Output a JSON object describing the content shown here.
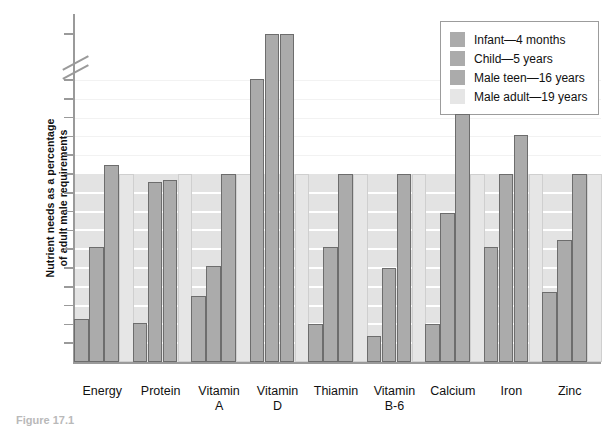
{
  "chart_data": {
    "type": "bar",
    "title": "",
    "xlabel": "",
    "ylabel": "Nutrient needs as a percentage of adult male requirements",
    "ylabel_line1": "Nutrient needs as a percentage",
    "ylabel_line2": "of adult male requirements",
    "categories": [
      "Energy",
      "Protein",
      "Vitamin\nA",
      "Vitamin\nD",
      "Thiamin",
      "Vitamin\nB-6",
      "Calcium",
      "Iron",
      "Zinc"
    ],
    "category_labels": [
      {
        "line1": "Energy",
        "line2": ""
      },
      {
        "line1": "Protein",
        "line2": ""
      },
      {
        "line1": "Vitamin",
        "line2": "A"
      },
      {
        "line1": "Vitamin",
        "line2": "D"
      },
      {
        "line1": "Thiamin",
        "line2": ""
      },
      {
        "line1": "Vitamin",
        "line2": "B-6"
      },
      {
        "line1": "Calcium",
        "line2": ""
      },
      {
        "line1": "Iron",
        "line2": ""
      },
      {
        "line1": "Zinc",
        "line2": ""
      }
    ],
    "series": [
      {
        "name": "Infant—4 months",
        "color": "#ababab",
        "values": [
          23,
          21,
          35,
          151,
          20,
          14,
          20,
          61,
          37
        ]
      },
      {
        "name": "Child—5 years",
        "color": "#ababab",
        "values": [
          61,
          96,
          51,
          200,
          61,
          50,
          79,
          100,
          65
        ]
      },
      {
        "name": "Male teen—16 years",
        "color": "#ababab",
        "values": [
          105,
          97,
          100,
          200,
          100,
          100,
          132,
          121,
          100
        ]
      },
      {
        "name": "Male adult—19 years",
        "color": "#e6e6e6",
        "values": [
          100,
          100,
          100,
          100,
          100,
          100,
          100,
          100,
          100
        ]
      }
    ],
    "ytick_labels": [
      "200",
      "150",
      "140",
      "130",
      "120",
      "110",
      "100",
      "90",
      "80",
      "70",
      "60",
      "50",
      "40",
      "30",
      "20",
      "10"
    ],
    "ytick_values": [
      200,
      150,
      140,
      130,
      120,
      110,
      100,
      90,
      80,
      70,
      60,
      50,
      40,
      30,
      20,
      10
    ],
    "ylim": [
      0,
      200
    ],
    "axis_break": true,
    "axis_break_between": [
      150,
      200
    ],
    "reference_line": 100,
    "grid": true,
    "legend_position": "top-right"
  },
  "legend": {
    "items": [
      {
        "label": "Infant—4 months",
        "color": "#ababab"
      },
      {
        "label": "Child—5 years",
        "color": "#ababab"
      },
      {
        "label": "Male teen—16 years",
        "color": "#ababab"
      },
      {
        "label": "Male adult—19 years",
        "color": "#e6e6e6"
      }
    ]
  },
  "caption": {
    "text": "Figure 17.1"
  },
  "colors": {
    "bar_fill": "#ababab",
    "bar_stroke": "#6d6d6d",
    "adult_fill": "#e6e6e6",
    "adult_stroke": "#cfcfcf",
    "reference_band": "#e3e3e3",
    "axis": "#9a9a9a",
    "text": "#111111"
  }
}
